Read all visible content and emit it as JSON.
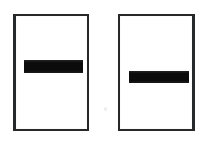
{
  "document": {
    "kind": "scanned-document-page",
    "background_color": "#fefefe",
    "speck_label": "scan-artifact-speck"
  },
  "frames": [
    {
      "id": "left",
      "label": "left-bordered-box",
      "border_color": "#27282a",
      "fill_color": "#ffffff",
      "redaction": {
        "label": "redaction-bar",
        "color": "#0b0b0c",
        "text": ""
      }
    },
    {
      "id": "right",
      "label": "right-bordered-box",
      "border_color": "#27282a",
      "fill_color": "#ffffff",
      "redaction": {
        "label": "redaction-bar",
        "color": "#0b0b0c",
        "text": ""
      }
    }
  ]
}
